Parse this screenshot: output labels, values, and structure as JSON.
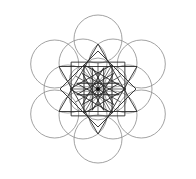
{
  "diagram": {
    "type": "geometric-pattern",
    "center": [
      98,
      89
    ],
    "colors": {
      "background": "#ffffff",
      "circle_stroke": "#8a8a8a",
      "line_stroke": "#2a2a2a",
      "center_dot": "#111111"
    },
    "outer_circles": {
      "count": 6,
      "ring_radius": 50,
      "radius": 24,
      "start_deg": 30
    },
    "middle_circles": {
      "count": 6,
      "ring_radius": 30,
      "radius": 24,
      "start_deg": 0
    },
    "inner_circles": {
      "count": 6,
      "ring_radius": 16,
      "radius": 15,
      "start_deg": 30
    },
    "stars": [
      {
        "points": 3,
        "radius": 45,
        "rotation_deg": -90
      },
      {
        "points": 3,
        "radius": 45,
        "rotation_deg": 90
      },
      {
        "points": 4,
        "radius": 38,
        "rotation_deg": 0
      },
      {
        "points": 4,
        "radius": 38,
        "rotation_deg": 45
      },
      {
        "points": 6,
        "radius": 28,
        "rotation_deg": 0,
        "step": 2
      },
      {
        "points": 12,
        "radius": 22,
        "rotation_deg": 15,
        "step": 5
      }
    ],
    "spokes": {
      "count": 12,
      "radius": 26
    }
  }
}
